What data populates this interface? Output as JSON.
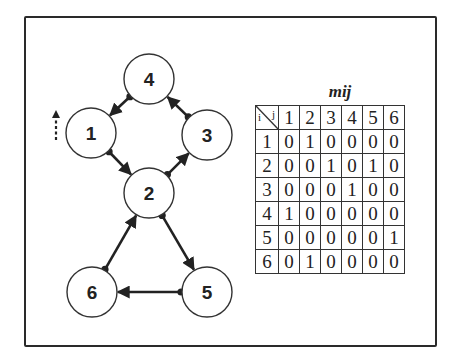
{
  "diagram": {
    "type": "directed-graph-with-adjacency-matrix",
    "nodes": [
      {
        "id": "1",
        "label": "1",
        "cx": 91,
        "cy": 133
      },
      {
        "id": "2",
        "label": "2",
        "cx": 149,
        "cy": 193
      },
      {
        "id": "3",
        "label": "3",
        "cx": 207,
        "cy": 135
      },
      {
        "id": "4",
        "label": "4",
        "cx": 149,
        "cy": 79
      },
      {
        "id": "5",
        "label": "5",
        "cx": 207,
        "cy": 292
      },
      {
        "id": "6",
        "label": "6",
        "cx": 92,
        "cy": 292
      }
    ],
    "node_radius": 25,
    "edges": [
      {
        "from": "1",
        "to": "2"
      },
      {
        "from": "2",
        "to": "3"
      },
      {
        "from": "2",
        "to": "5"
      },
      {
        "from": "3",
        "to": "4"
      },
      {
        "from": "4",
        "to": "1"
      },
      {
        "from": "5",
        "to": "6"
      },
      {
        "from": "6",
        "to": "2"
      }
    ],
    "side_marker": "dashed-up-arrow"
  },
  "matrix": {
    "title": "m",
    "title_subscript": "ij",
    "corner_row_label": "i",
    "corner_col_label": "j",
    "column_headers": [
      "1",
      "2",
      "3",
      "4",
      "5",
      "6"
    ],
    "rows": [
      {
        "label": "1",
        "values": [
          "0",
          "1",
          "0",
          "0",
          "0",
          "0"
        ]
      },
      {
        "label": "2",
        "values": [
          "0",
          "0",
          "1",
          "0",
          "1",
          "0"
        ]
      },
      {
        "label": "3",
        "values": [
          "0",
          "0",
          "0",
          "1",
          "0",
          "0"
        ]
      },
      {
        "label": "4",
        "values": [
          "1",
          "0",
          "0",
          "0",
          "0",
          "0"
        ]
      },
      {
        "label": "5",
        "values": [
          "0",
          "0",
          "0",
          "0",
          "0",
          "1"
        ]
      },
      {
        "label": "6",
        "values": [
          "0",
          "1",
          "0",
          "0",
          "0",
          "0"
        ]
      }
    ]
  },
  "colors": {
    "ink": "#222222",
    "background": "#ffffff"
  }
}
